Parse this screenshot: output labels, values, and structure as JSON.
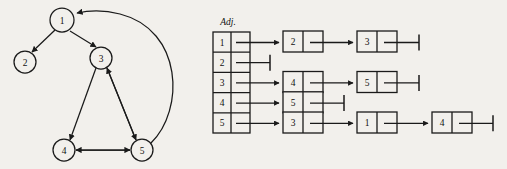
{
  "figure": {
    "title_label": "Adj.",
    "stroke_color": "#1a1a1a",
    "background_color": "#f2f0ec",
    "text_color": "#111111"
  },
  "graph": {
    "nodes": [
      {
        "id": "1",
        "label": "1",
        "cx": 62,
        "cy": 20,
        "r": 12
      },
      {
        "id": "2",
        "label": "2",
        "cx": 25,
        "cy": 62,
        "r": 11
      },
      {
        "id": "3",
        "label": "3",
        "cx": 101,
        "cy": 58,
        "r": 11
      },
      {
        "id": "4",
        "label": "4",
        "cx": 64,
        "cy": 150,
        "r": 11
      },
      {
        "id": "5",
        "label": "5",
        "cx": 142,
        "cy": 150,
        "r": 11
      }
    ],
    "edges": [
      {
        "from": "1",
        "to": "2",
        "directed": true,
        "curved": false
      },
      {
        "from": "1",
        "to": "3",
        "directed": true,
        "curved": false
      },
      {
        "from": "3",
        "to": "4",
        "directed": true,
        "curved": false
      },
      {
        "from": "3",
        "to": "5",
        "directed": true,
        "curved": false
      },
      {
        "from": "5",
        "to": "3",
        "directed": true,
        "curved": false
      },
      {
        "from": "4",
        "to": "5",
        "directed": true,
        "curved": false
      },
      {
        "from": "5",
        "to": "4",
        "directed": true,
        "curved": false
      },
      {
        "from": "5",
        "to": "1",
        "directed": true,
        "curved": true
      }
    ]
  },
  "adjacency": {
    "header_label": "Adj.",
    "rows": [
      {
        "index": "1",
        "chain": [
          "2",
          "3"
        ]
      },
      {
        "index": "2",
        "chain": []
      },
      {
        "index": "3",
        "chain": [
          "4",
          "5"
        ]
      },
      {
        "index": "4",
        "chain": [
          "5"
        ]
      },
      {
        "index": "5",
        "chain": [
          "3",
          "1",
          "4"
        ]
      }
    ]
  }
}
